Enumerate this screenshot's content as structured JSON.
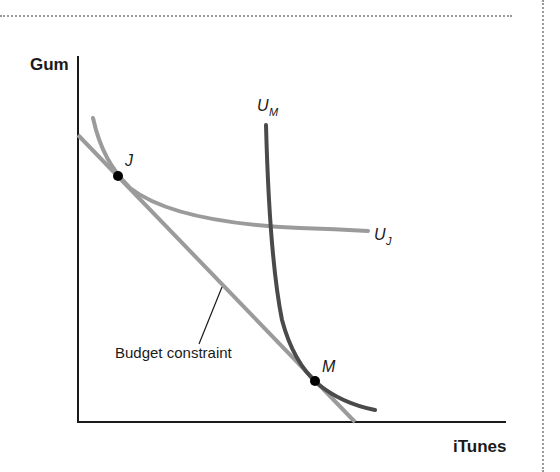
{
  "diagram": {
    "title": "",
    "axes": {
      "y_label": "Gum",
      "x_label": "iTunes"
    },
    "curves": {
      "budget_constraint": {
        "label": "Budget constraint",
        "color": "#9b9b9b"
      },
      "u_j": {
        "label_main": "U",
        "label_sub": "J",
        "color": "#9b9b9b"
      },
      "u_m": {
        "label_main": "U",
        "label_sub": "M",
        "color": "#4a4a4a"
      }
    },
    "points": [
      {
        "label": "J",
        "description": "Tangency of budget constraint and U_J"
      },
      {
        "label": "M",
        "description": "Tangency of budget constraint and U_M"
      }
    ],
    "colors": {
      "axis": "#1a1a1a",
      "frame_dots": "#9a9a9a",
      "point": "#000000"
    }
  }
}
